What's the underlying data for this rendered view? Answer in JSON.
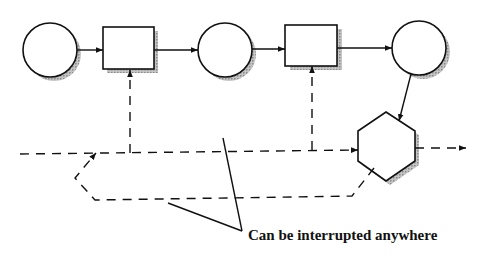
{
  "diagram": {
    "type": "flow",
    "nodes": [
      {
        "id": "circle-1",
        "shape": "circle",
        "label": ""
      },
      {
        "id": "rect-1",
        "shape": "rectangle",
        "label": ""
      },
      {
        "id": "circle-2",
        "shape": "circle",
        "label": ""
      },
      {
        "id": "rect-2",
        "shape": "rectangle",
        "label": ""
      },
      {
        "id": "circle-3",
        "shape": "circle",
        "label": ""
      },
      {
        "id": "hexagon",
        "shape": "hexagon",
        "label": ""
      }
    ],
    "edges": [
      {
        "from": "circle-1",
        "to": "rect-1",
        "style": "solid"
      },
      {
        "from": "rect-1",
        "to": "circle-2",
        "style": "solid"
      },
      {
        "from": "circle-2",
        "to": "rect-2",
        "style": "solid"
      },
      {
        "from": "rect-2",
        "to": "circle-3",
        "style": "solid"
      },
      {
        "from": "circle-3",
        "to": "hexagon",
        "style": "solid"
      },
      {
        "from": "interrupt-line",
        "to": "rect-1",
        "style": "dashed"
      },
      {
        "from": "interrupt-line",
        "to": "rect-2",
        "style": "dashed"
      },
      {
        "from": "interrupt-line",
        "to": "hexagon",
        "style": "dashed"
      },
      {
        "from": "hexagon",
        "to": "output",
        "style": "dashed"
      },
      {
        "from": "hexagon",
        "to": "interrupt-line",
        "style": "dashed",
        "note": "return loop"
      }
    ],
    "annotation": "Can be interrupted anywhere",
    "colors": {
      "stroke": "#111111",
      "shadow": "#9a9a9a",
      "fill": "#ffffff"
    }
  }
}
